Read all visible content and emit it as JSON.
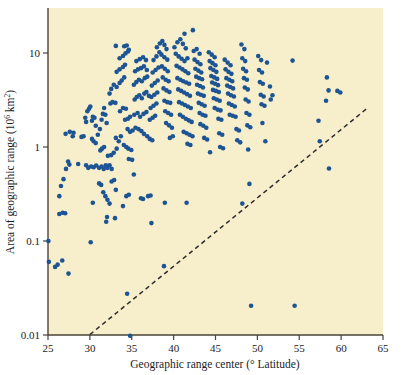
{
  "figure": {
    "background_color": "#f7eecb",
    "page_background": "#ffffff",
    "point_color": "#1d5493",
    "axis_color": "#4a4336",
    "trendline_color": "#2b2b2b"
  },
  "axes": {
    "x": {
      "label_prefix": "Geographic range center (",
      "label_degree": "°",
      "label_suffix": " Latitude)",
      "label_full": "Geographic range center (° Latitude)",
      "ticks": [
        "25",
        "30",
        "35",
        "40",
        "45",
        "50",
        "55",
        "60",
        "65"
      ],
      "tick_values": [
        25,
        30,
        35,
        40,
        45,
        50,
        55,
        60,
        65
      ],
      "range": [
        25,
        65
      ]
    },
    "y": {
      "label_prefix": "Area of geographic range (10",
      "label_exponent": "6",
      "label_mid": " km",
      "label_exponent2": "2",
      "label_suffix": ")",
      "label_full": "Area of geographic range (10⁶ km²)",
      "ticks": [
        "10",
        "1",
        "0.1",
        "0.01"
      ],
      "tick_values": [
        10,
        1,
        0.1,
        0.01
      ],
      "scale": "log",
      "range": [
        0.01,
        20
      ]
    }
  },
  "chart_data": {
    "type": "scatter",
    "title": "",
    "xlabel": "Geographic range center (° Latitude)",
    "ylabel": "Area of geographic range (10⁶ km²)",
    "xlim": [
      25,
      65
    ],
    "ylim": [
      0.01,
      20
    ],
    "yscale": "log",
    "grid": false,
    "legend": null,
    "marker": {
      "shape": "circle",
      "color": "#1d5493",
      "size_px": 4.4
    },
    "annotations": [
      {
        "type": "dashed-line",
        "name": "minimum-range-boundary",
        "style": "dashed",
        "color": "#2b2b2b",
        "from": {
          "x": 30.0,
          "y": 0.0101
        },
        "to": {
          "x": 63.2,
          "y": 2.62
        }
      }
    ],
    "points": [
      [
        25.05,
        0.1
      ],
      [
        25.1,
        0.06
      ],
      [
        25.85,
        0.053
      ],
      [
        26.15,
        0.056
      ],
      [
        26.7,
        0.062
      ],
      [
        27.45,
        0.045
      ],
      [
        26.35,
        0.194
      ],
      [
        26.75,
        0.2
      ],
      [
        27.05,
        0.197
      ],
      [
        26.35,
        0.3
      ],
      [
        26.55,
        0.385
      ],
      [
        26.85,
        0.455
      ],
      [
        27.15,
        0.585
      ],
      [
        27.4,
        0.7
      ],
      [
        27.55,
        0.65
      ],
      [
        27.1,
        1.38
      ],
      [
        27.6,
        1.45
      ],
      [
        27.95,
        1.3
      ],
      [
        28.05,
        1.42
      ],
      [
        28.6,
        0.66
      ],
      [
        29.0,
        1.28
      ],
      [
        29.25,
        1.3
      ],
      [
        29.45,
        2.05
      ],
      [
        29.7,
        2.4
      ],
      [
        29.9,
        2.55
      ],
      [
        30.05,
        2.7
      ],
      [
        29.55,
        1.85
      ],
      [
        30.25,
        1.9
      ],
      [
        30.35,
        2.1
      ],
      [
        30.55,
        2.05
      ],
      [
        30.7,
        1.68
      ],
      [
        30.25,
        1.22
      ],
      [
        30.45,
        1.15
      ],
      [
        30.7,
        1.1
      ],
      [
        30.95,
        1.35
      ],
      [
        31.2,
        1.55
      ],
      [
        31.4,
        1.95
      ],
      [
        31.55,
        2.25
      ],
      [
        31.7,
        2.6
      ],
      [
        31.85,
        2.2
      ],
      [
        32.0,
        1.8
      ],
      [
        31.25,
        0.92
      ],
      [
        31.45,
        0.96
      ],
      [
        31.7,
        1.0
      ],
      [
        30.1,
        0.097
      ],
      [
        29.55,
        0.64
      ],
      [
        29.8,
        0.6
      ],
      [
        30.15,
        0.62
      ],
      [
        30.45,
        0.61
      ],
      [
        30.75,
        0.635
      ],
      [
        31.1,
        0.6
      ],
      [
        31.4,
        0.62
      ],
      [
        31.65,
        0.585
      ],
      [
        31.9,
        0.64
      ],
      [
        32.1,
        0.6
      ],
      [
        32.35,
        0.64
      ],
      [
        32.6,
        0.585
      ],
      [
        31.1,
        0.41
      ],
      [
        31.35,
        0.395
      ],
      [
        31.6,
        0.33
      ],
      [
        31.85,
        0.3
      ],
      [
        32.1,
        0.275
      ],
      [
        32.35,
        0.25
      ],
      [
        32.05,
        0.18
      ],
      [
        31.95,
        0.16
      ],
      [
        32.6,
        0.43
      ],
      [
        32.9,
        0.445
      ],
      [
        33.1,
        0.35
      ],
      [
        33.0,
        0.175
      ],
      [
        30.35,
        0.255
      ],
      [
        32.15,
        0.805
      ],
      [
        32.55,
        0.82
      ],
      [
        32.85,
        0.87
      ],
      [
        33.2,
        0.96
      ],
      [
        33.1,
        1.25
      ],
      [
        33.45,
        1.15
      ],
      [
        33.7,
        1.3
      ],
      [
        32.45,
        2.9
      ],
      [
        32.7,
        3.0
      ],
      [
        33.05,
        2.95
      ],
      [
        32.35,
        3.7
      ],
      [
        32.55,
        4.15
      ],
      [
        32.85,
        4.6
      ],
      [
        33.2,
        4.35
      ],
      [
        33.55,
        4.8
      ],
      [
        33.8,
        5.1
      ],
      [
        34.1,
        5.5
      ],
      [
        33.2,
        6.3
      ],
      [
        33.55,
        6.7
      ],
      [
        33.95,
        7.1
      ],
      [
        34.2,
        7.5
      ],
      [
        33.55,
        8.8
      ],
      [
        33.95,
        9.3
      ],
      [
        34.25,
        9.9
      ],
      [
        34.55,
        10.4
      ],
      [
        34.1,
        11.8
      ],
      [
        34.4,
        12.0
      ],
      [
        34.65,
        10.8
      ],
      [
        33.1,
        11.9
      ],
      [
        33.6,
        2.4
      ],
      [
        33.95,
        2.6
      ],
      [
        34.3,
        2.55
      ],
      [
        34.2,
        1.95
      ],
      [
        34.55,
        2.0
      ],
      [
        34.8,
        2.1
      ],
      [
        34.5,
        1.55
      ],
      [
        34.8,
        1.45
      ],
      [
        35.1,
        1.5
      ],
      [
        34.05,
        1.05
      ],
      [
        34.35,
        1.0
      ],
      [
        34.6,
        0.96
      ],
      [
        34.95,
        0.93
      ],
      [
        34.65,
        0.745
      ],
      [
        35.05,
        0.73
      ],
      [
        34.35,
        0.3
      ],
      [
        34.65,
        0.31
      ],
      [
        33.95,
        0.235
      ],
      [
        34.45,
        0.0275
      ],
      [
        34.8,
        0.0098
      ],
      [
        35.25,
        0.51
      ],
      [
        36.1,
        0.285
      ],
      [
        36.35,
        0.28
      ],
      [
        36.95,
        0.3
      ],
      [
        37.25,
        0.305
      ],
      [
        37.35,
        0.155
      ],
      [
        35.35,
        3.2
      ],
      [
        35.6,
        3.4
      ],
      [
        35.9,
        3.55
      ],
      [
        36.2,
        3.3
      ],
      [
        36.5,
        3.7
      ],
      [
        36.75,
        3.85
      ],
      [
        37.05,
        3.5
      ],
      [
        35.25,
        4.6
      ],
      [
        35.55,
        4.9
      ],
      [
        35.85,
        5.2
      ],
      [
        36.2,
        5.0
      ],
      [
        36.55,
        5.4
      ],
      [
        36.85,
        5.6
      ],
      [
        35.4,
        6.4
      ],
      [
        35.75,
        6.7
      ],
      [
        36.1,
        6.9
      ],
      [
        36.45,
        7.2
      ],
      [
        36.8,
        6.6
      ],
      [
        35.55,
        8.2
      ],
      [
        35.95,
        8.6
      ],
      [
        36.35,
        9.0
      ],
      [
        36.7,
        8.4
      ],
      [
        35.3,
        2.2
      ],
      [
        35.7,
        2.3
      ],
      [
        36.0,
        2.1
      ],
      [
        36.4,
        2.25
      ],
      [
        36.75,
        2.35
      ],
      [
        35.45,
        1.6
      ],
      [
        35.8,
        1.55
      ],
      [
        36.15,
        1.48
      ],
      [
        36.45,
        1.38
      ],
      [
        36.85,
        1.3
      ],
      [
        37.15,
        1.22
      ],
      [
        37.45,
        1.18
      ],
      [
        37.15,
        1.95
      ],
      [
        37.5,
        2.05
      ],
      [
        37.8,
        2.15
      ],
      [
        37.25,
        2.6
      ],
      [
        37.6,
        2.75
      ],
      [
        37.95,
        2.9
      ],
      [
        37.35,
        3.4
      ],
      [
        37.7,
        3.6
      ],
      [
        38.05,
        3.8
      ],
      [
        37.4,
        4.5
      ],
      [
        37.75,
        4.8
      ],
      [
        38.1,
        5.1
      ],
      [
        37.5,
        6.2
      ],
      [
        37.85,
        6.6
      ],
      [
        38.2,
        7.0
      ],
      [
        37.6,
        8.4
      ],
      [
        37.95,
        9.2
      ],
      [
        38.3,
        10.2
      ],
      [
        38.0,
        11.5
      ],
      [
        38.35,
        12.6
      ],
      [
        38.65,
        13.4
      ],
      [
        38.9,
        12.2
      ],
      [
        39.15,
        11.0
      ],
      [
        38.55,
        9.6
      ],
      [
        38.9,
        9.0
      ],
      [
        39.25,
        8.5
      ],
      [
        38.6,
        7.2
      ],
      [
        38.95,
        6.8
      ],
      [
        39.3,
        6.4
      ],
      [
        38.7,
        5.5
      ],
      [
        39.05,
        5.2
      ],
      [
        39.4,
        5.0
      ],
      [
        38.8,
        4.2
      ],
      [
        39.15,
        4.0
      ],
      [
        39.5,
        3.85
      ],
      [
        38.9,
        3.1
      ],
      [
        39.25,
        3.0
      ],
      [
        39.6,
        2.95
      ],
      [
        39.0,
        2.4
      ],
      [
        39.35,
        2.3
      ],
      [
        39.7,
        2.2
      ],
      [
        39.1,
        1.8
      ],
      [
        39.45,
        1.7
      ],
      [
        39.8,
        1.6
      ],
      [
        39.55,
        1.25
      ],
      [
        39.9,
        1.3
      ],
      [
        38.85,
        0.054
      ],
      [
        38.95,
        0.255
      ],
      [
        40.1,
        11.5
      ],
      [
        40.45,
        13.0
      ],
      [
        40.8,
        14.0
      ],
      [
        41.1,
        12.5
      ],
      [
        41.45,
        11.2
      ],
      [
        40.25,
        9.8
      ],
      [
        40.6,
        9.2
      ],
      [
        40.95,
        8.7
      ],
      [
        41.3,
        8.2
      ],
      [
        41.65,
        8.8
      ],
      [
        40.35,
        7.3
      ],
      [
        40.7,
        7.0
      ],
      [
        41.05,
        6.7
      ],
      [
        41.4,
        6.4
      ],
      [
        41.75,
        6.1
      ],
      [
        40.45,
        5.4
      ],
      [
        40.8,
        5.2
      ],
      [
        41.15,
        5.0
      ],
      [
        41.5,
        4.85
      ],
      [
        41.85,
        4.7
      ],
      [
        40.55,
        4.1
      ],
      [
        40.9,
        3.95
      ],
      [
        41.25,
        3.8
      ],
      [
        41.6,
        3.65
      ],
      [
        41.95,
        3.5
      ],
      [
        40.65,
        3.0
      ],
      [
        41.0,
        2.9
      ],
      [
        41.35,
        2.8
      ],
      [
        41.7,
        2.7
      ],
      [
        42.05,
        2.6
      ],
      [
        40.75,
        2.2
      ],
      [
        41.1,
        2.1
      ],
      [
        41.45,
        2.0
      ],
      [
        41.8,
        1.92
      ],
      [
        42.15,
        1.85
      ],
      [
        41.2,
        1.45
      ],
      [
        41.55,
        1.4
      ],
      [
        41.9,
        1.35
      ],
      [
        42.25,
        1.3
      ],
      [
        41.65,
        1.08
      ],
      [
        42.0,
        1.05
      ],
      [
        41.55,
        0.255
      ],
      [
        42.3,
        17.5
      ],
      [
        41.3,
        16.0
      ],
      [
        42.4,
        10.5
      ],
      [
        42.75,
        11.0
      ],
      [
        43.1,
        9.8
      ],
      [
        42.5,
        8.5
      ],
      [
        42.85,
        8.0
      ],
      [
        43.2,
        7.6
      ],
      [
        42.6,
        6.8
      ],
      [
        42.95,
        6.5
      ],
      [
        43.3,
        6.2
      ],
      [
        42.7,
        5.6
      ],
      [
        43.05,
        5.4
      ],
      [
        43.4,
        5.25
      ],
      [
        42.8,
        4.6
      ],
      [
        43.15,
        4.45
      ],
      [
        43.5,
        4.3
      ],
      [
        42.9,
        3.7
      ],
      [
        43.25,
        3.6
      ],
      [
        43.6,
        3.5
      ],
      [
        43.0,
        2.95
      ],
      [
        43.35,
        2.85
      ],
      [
        43.7,
        2.75
      ],
      [
        43.1,
        2.3
      ],
      [
        43.45,
        2.2
      ],
      [
        43.8,
        2.15
      ],
      [
        43.2,
        1.75
      ],
      [
        43.55,
        1.68
      ],
      [
        43.9,
        1.6
      ],
      [
        43.65,
        1.25
      ],
      [
        44.0,
        1.2
      ],
      [
        44.2,
        10.2
      ],
      [
        44.55,
        9.6
      ],
      [
        44.9,
        9.0
      ],
      [
        44.3,
        8.2
      ],
      [
        44.65,
        7.8
      ],
      [
        45.0,
        7.4
      ],
      [
        44.4,
        6.9
      ],
      [
        44.75,
        6.6
      ],
      [
        45.1,
        6.3
      ],
      [
        44.5,
        5.7
      ],
      [
        44.85,
        5.5
      ],
      [
        45.2,
        5.3
      ],
      [
        44.6,
        4.85
      ],
      [
        44.95,
        4.7
      ],
      [
        45.3,
        4.55
      ],
      [
        44.7,
        4.05
      ],
      [
        45.05,
        3.95
      ],
      [
        45.4,
        3.85
      ],
      [
        44.8,
        3.3
      ],
      [
        45.15,
        3.2
      ],
      [
        45.5,
        3.1
      ],
      [
        44.9,
        2.6
      ],
      [
        45.25,
        2.5
      ],
      [
        45.6,
        2.45
      ],
      [
        45.35,
        2.0
      ],
      [
        45.7,
        1.95
      ],
      [
        45.45,
        1.4
      ],
      [
        45.8,
        1.35
      ],
      [
        45.55,
        1.0
      ],
      [
        45.9,
        0.97
      ],
      [
        44.35,
        0.88
      ],
      [
        46.1,
        8.5
      ],
      [
        46.45,
        7.9
      ],
      [
        46.8,
        7.4
      ],
      [
        46.2,
        6.7
      ],
      [
        46.55,
        6.3
      ],
      [
        46.9,
        6.0
      ],
      [
        46.3,
        5.4
      ],
      [
        46.65,
        5.2
      ],
      [
        47.0,
        5.0
      ],
      [
        46.4,
        4.5
      ],
      [
        46.75,
        4.35
      ],
      [
        47.1,
        4.2
      ],
      [
        46.5,
        3.7
      ],
      [
        46.85,
        3.55
      ],
      [
        47.2,
        3.45
      ],
      [
        46.6,
        2.9
      ],
      [
        46.95,
        2.8
      ],
      [
        47.3,
        2.7
      ],
      [
        46.7,
        2.2
      ],
      [
        47.05,
        2.15
      ],
      [
        47.4,
        2.1
      ],
      [
        47.5,
        1.55
      ],
      [
        47.8,
        1.5
      ],
      [
        47.6,
        1.18
      ],
      [
        47.95,
        1.12
      ],
      [
        48.1,
        12.3
      ],
      [
        48.45,
        11.0
      ],
      [
        48.2,
        8.8
      ],
      [
        48.55,
        8.2
      ],
      [
        48.3,
        6.8
      ],
      [
        48.65,
        6.4
      ],
      [
        48.4,
        5.4
      ],
      [
        48.75,
        5.2
      ],
      [
        48.5,
        4.3
      ],
      [
        48.85,
        4.1
      ],
      [
        48.6,
        3.2
      ],
      [
        48.95,
        3.05
      ],
      [
        48.7,
        2.3
      ],
      [
        49.05,
        2.2
      ],
      [
        48.8,
        1.7
      ],
      [
        49.15,
        1.62
      ],
      [
        48.9,
        0.94
      ],
      [
        48.2,
        0.25
      ],
      [
        49.05,
        0.405
      ],
      [
        50.1,
        9.3
      ],
      [
        50.45,
        8.4
      ],
      [
        50.2,
        6.6
      ],
      [
        50.55,
        6.2
      ],
      [
        50.3,
        4.9
      ],
      [
        50.65,
        4.7
      ],
      [
        50.4,
        3.6
      ],
      [
        50.75,
        3.45
      ],
      [
        50.5,
        2.85
      ],
      [
        50.85,
        2.75
      ],
      [
        50.6,
        1.8
      ],
      [
        50.95,
        1.15
      ],
      [
        51.15,
        7.9
      ],
      [
        51.5,
        4.4
      ],
      [
        51.8,
        3.55
      ],
      [
        51.6,
        3.2
      ],
      [
        49.25,
        0.0205
      ],
      [
        54.45,
        0.0205
      ],
      [
        54.2,
        8.3
      ],
      [
        57.3,
        1.9
      ],
      [
        57.45,
        1.15
      ],
      [
        58.3,
        5.5
      ],
      [
        58.5,
        4.0
      ],
      [
        58.2,
        3.1
      ],
      [
        58.55,
        0.59
      ],
      [
        59.9,
        3.8
      ],
      [
        59.55,
        3.95
      ]
    ]
  }
}
